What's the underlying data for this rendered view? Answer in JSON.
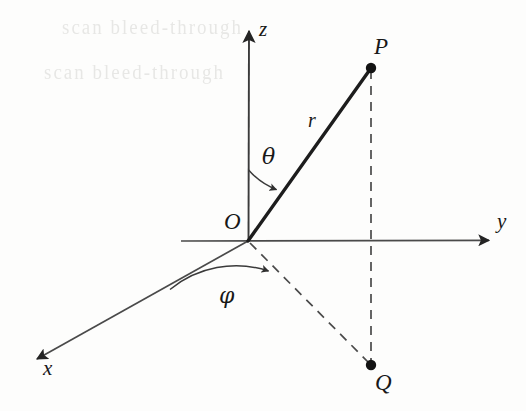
{
  "figure": {
    "background_color": "#fdfdfc",
    "ink_color": "#242424"
  },
  "axes": [
    {
      "id": "x",
      "label": "x",
      "origin": [
        248,
        241
      ],
      "tip": [
        33,
        361
      ],
      "style": "solid-arrow"
    },
    {
      "id": "y",
      "label": "y",
      "origin": [
        248,
        241
      ],
      "tip": [
        492,
        240
      ],
      "style": "solid-arrow"
    },
    {
      "id": "z",
      "label": "z",
      "origin": [
        248,
        241
      ],
      "tip": [
        249,
        28
      ],
      "style": "solid-arrow"
    }
  ],
  "points": [
    {
      "id": "O",
      "label": "O",
      "position": [
        248,
        241
      ],
      "marked": false
    },
    {
      "id": "P",
      "label": "P",
      "position": [
        371,
        68
      ],
      "marked": true
    },
    {
      "id": "Q",
      "label": "Q",
      "position": [
        371,
        365
      ],
      "marked": true
    }
  ],
  "segments": [
    {
      "id": "OP",
      "label": "r",
      "from": [
        248,
        241
      ],
      "to": [
        371,
        68
      ],
      "style": "solid-thick"
    },
    {
      "id": "PQ",
      "label": "",
      "from": [
        371,
        68
      ],
      "to": [
        371,
        365
      ],
      "style": "dashed"
    },
    {
      "id": "OQ",
      "label": "",
      "from": [
        248,
        241
      ],
      "to": [
        371,
        365
      ],
      "style": "dashed"
    }
  ],
  "angles": [
    {
      "id": "theta",
      "label": "θ",
      "between": [
        "z-axis",
        "OP"
      ],
      "arrow_target": "OP"
    },
    {
      "id": "phi",
      "label": "φ",
      "between": [
        "x-axis",
        "OQ"
      ],
      "arrow_target": "OQ"
    }
  ],
  "labels": {
    "axis_x": "x",
    "axis_y": "y",
    "axis_z": "z",
    "point_o": "O",
    "point_p": "P",
    "point_q": "Q",
    "radius": "r",
    "polar_angle": "θ",
    "azimuthal_angle": "φ"
  },
  "artifacts": {
    "ghost_text_line_1": "scan bleed-through",
    "ghost_text_line_2": "scan bleed-through"
  }
}
